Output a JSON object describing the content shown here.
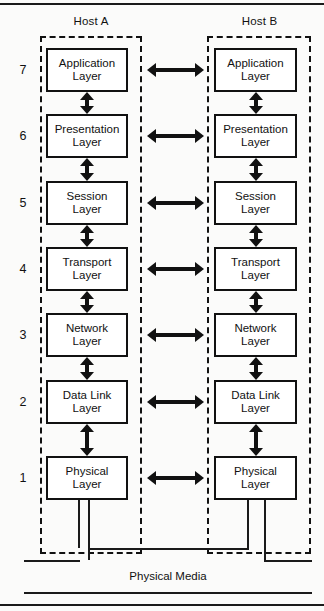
{
  "diagram": {
    "hosts": [
      {
        "id": "host-a",
        "label": "Host A"
      },
      {
        "id": "host-b",
        "label": "Host B"
      }
    ],
    "layers": [
      {
        "number": "7",
        "line1": "Application",
        "line2": "Layer"
      },
      {
        "number": "6",
        "line1": "Presentation",
        "line2": "Layer"
      },
      {
        "number": "5",
        "line1": "Session",
        "line2": "Layer"
      },
      {
        "number": "4",
        "line1": "Transport",
        "line2": "Layer"
      },
      {
        "number": "3",
        "line1": "Network",
        "line2": "Layer"
      },
      {
        "number": "2",
        "line1": "Data Link",
        "line2": "Layer"
      },
      {
        "number": "1",
        "line1": "Physical",
        "line2": "Layer"
      }
    ],
    "media": {
      "label": "Physical Media"
    },
    "colors": {
      "ink": "#111111",
      "paper": "#fbfbfa",
      "box_fill": "#ffffff"
    }
  }
}
